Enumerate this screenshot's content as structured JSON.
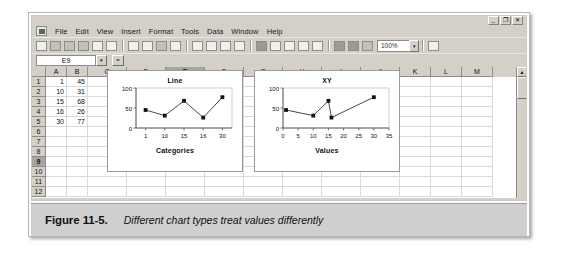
{
  "window": {
    "app_icon": "excel-icon",
    "buttons": [
      {
        "name": "minimize",
        "glyph": "_"
      },
      {
        "name": "restore",
        "glyph": "❐"
      },
      {
        "name": "close",
        "glyph": "✕"
      }
    ]
  },
  "menu": {
    "items": [
      "File",
      "Edit",
      "View",
      "Insert",
      "Format",
      "Tools",
      "Data",
      "Window",
      "Help"
    ]
  },
  "toolbar": {
    "buttons": [
      {
        "name": "new-document-icon",
        "glyph": "🗋",
        "tone": "light"
      },
      {
        "name": "open-folder-icon",
        "glyph": "📂",
        "tone": "mid"
      },
      {
        "name": "save-icon",
        "glyph": "💾",
        "tone": "mid"
      },
      {
        "name": "print-icon",
        "glyph": "🖨",
        "tone": "mid"
      },
      {
        "name": "print-preview-icon",
        "glyph": "🔍",
        "tone": "light"
      },
      {
        "name": "spelling-icon",
        "glyph": "✓",
        "tone": "light"
      },
      {
        "name": "cut-icon",
        "glyph": "✂",
        "tone": "light"
      },
      {
        "name": "copy-icon",
        "glyph": "⧉",
        "tone": "light"
      },
      {
        "name": "paste-icon",
        "glyph": "📋",
        "tone": "mid"
      },
      {
        "name": "format-painter-icon",
        "glyph": "🖌",
        "tone": "light"
      },
      {
        "name": "undo-icon",
        "glyph": "↶",
        "tone": "light"
      },
      {
        "name": "undo-dropdown-icon",
        "glyph": "▾",
        "tone": "light"
      },
      {
        "name": "redo-icon",
        "glyph": "↷",
        "tone": "light"
      },
      {
        "name": "redo-dropdown-icon",
        "glyph": "▾",
        "tone": "light"
      },
      {
        "name": "insert-hyperlink-icon",
        "glyph": "🌐",
        "tone": "dark"
      },
      {
        "name": "autosum-icon",
        "glyph": "Σ",
        "tone": "light"
      },
      {
        "name": "paste-function-icon",
        "glyph": "ƒ",
        "tone": "light"
      },
      {
        "name": "sort-ascending-icon",
        "glyph": "↓",
        "tone": "light"
      },
      {
        "name": "sort-descending-icon",
        "glyph": "↑",
        "tone": "light"
      },
      {
        "name": "chart-wizard-icon",
        "glyph": "▥",
        "tone": "dark"
      },
      {
        "name": "map-icon",
        "glyph": "◍",
        "tone": "dark"
      },
      {
        "name": "drawing-icon",
        "glyph": "✎",
        "tone": "mid"
      }
    ],
    "zoom_value": "100%",
    "zoom_arrow": "▾",
    "help_icon": "?",
    "help_arrow": "▾"
  },
  "formula_bar": {
    "name_box_value": "E9",
    "name_box_arrow": "▾",
    "function_button": "=",
    "formula_value": ""
  },
  "grid": {
    "columns": [
      "A",
      "B",
      "C",
      "D",
      "E",
      "F",
      "G",
      "H",
      "I",
      "J",
      "K",
      "L",
      "M"
    ],
    "selected_column": "E",
    "rows": [
      "1",
      "2",
      "3",
      "4",
      "5",
      "6",
      "7",
      "8",
      "9",
      "10",
      "11",
      "12"
    ],
    "selected_row": "9",
    "data": [
      [
        "1",
        "45"
      ],
      [
        "10",
        "31"
      ],
      [
        "15",
        "68"
      ],
      [
        "16",
        "26"
      ],
      [
        "30",
        "77"
      ],
      [
        "",
        ""
      ],
      [
        "",
        ""
      ],
      [
        "",
        ""
      ],
      [
        "",
        ""
      ],
      [
        "",
        ""
      ],
      [
        "",
        ""
      ],
      [
        "",
        ""
      ]
    ],
    "scroll_up_arrow": "▲",
    "scroll_down_arrow": "▼"
  },
  "chart_data": [
    {
      "type": "line",
      "title": "Line",
      "xlabel": "Categories",
      "ylabel": "",
      "categories": [
        "1",
        "10",
        "15",
        "16",
        "30"
      ],
      "values": [
        45,
        31,
        68,
        26,
        77
      ],
      "yticks": [
        "0",
        "50",
        "100"
      ],
      "ylim": [
        0,
        100
      ],
      "grid": false,
      "legend": "none",
      "marker": "square"
    },
    {
      "type": "scatter",
      "title": "XY",
      "xlabel": "Values",
      "ylabel": "",
      "x": [
        1,
        10,
        15,
        16,
        30
      ],
      "values": [
        45,
        31,
        68,
        26,
        77
      ],
      "xticks": [
        "0",
        "5",
        "10",
        "15",
        "20",
        "25",
        "30",
        "35"
      ],
      "xlim": [
        0,
        35
      ],
      "yticks": [
        "0",
        "50",
        "100"
      ],
      "ylim": [
        0,
        100
      ],
      "grid": false,
      "legend": "none",
      "marker": "square"
    }
  ],
  "caption": {
    "number": "Figure 11-5.",
    "text": "Different chart types treat values differently"
  }
}
